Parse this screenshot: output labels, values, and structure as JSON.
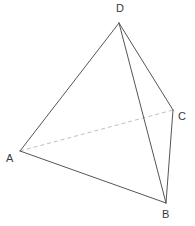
{
  "figure": {
    "kind": "geometry-diagram",
    "shape_name": "tetrahedron",
    "background_color": "#ffffff",
    "canvas": {
      "width": 195,
      "height": 226
    },
    "solid_edge_color": "#555555",
    "hidden_edge_color": "#c0c0c0",
    "label_color": "#3a3a3a",
    "stroke_width": 1,
    "hidden_dash_pattern": "4 3",
    "vertices": [
      {
        "id": "D",
        "label": "D",
        "x": 119,
        "y": 23,
        "label_x": 116,
        "label_y": 3
      },
      {
        "id": "A",
        "label": "A",
        "x": 20,
        "y": 151,
        "label_x": 6,
        "label_y": 153
      },
      {
        "id": "B",
        "label": "B",
        "x": 166,
        "y": 203,
        "label_x": 162,
        "label_y": 209
      },
      {
        "id": "C",
        "label": "C",
        "x": 173,
        "y": 110,
        "label_x": 178,
        "label_y": 111
      }
    ],
    "edges": [
      {
        "id": "AD",
        "from": "A",
        "to": "D",
        "style": "solid",
        "hidden": false
      },
      {
        "id": "AB",
        "from": "A",
        "to": "B",
        "style": "solid",
        "hidden": false
      },
      {
        "id": "DB",
        "from": "D",
        "to": "B",
        "style": "solid",
        "hidden": false
      },
      {
        "id": "DC",
        "from": "D",
        "to": "C",
        "style": "solid",
        "hidden": false
      },
      {
        "id": "CB",
        "from": "C",
        "to": "B",
        "style": "solid",
        "hidden": false
      },
      {
        "id": "AC",
        "from": "A",
        "to": "C",
        "style": "dashed",
        "hidden": true
      }
    ]
  }
}
